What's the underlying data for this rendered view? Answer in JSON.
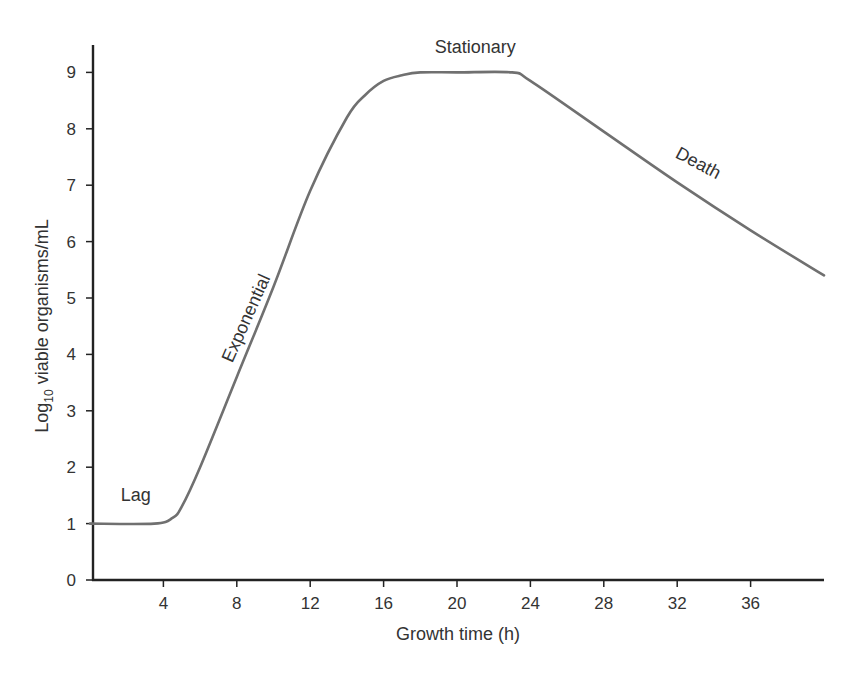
{
  "chart_data": {
    "type": "line",
    "title": "",
    "xlabel": "Growth time (h)",
    "ylabel": "Log10 viable organisms/mL",
    "ylabel_parts": {
      "base": "Log",
      "sub": "10",
      "rest": " viable organisms/mL"
    },
    "xlim": [
      0,
      40
    ],
    "ylim": [
      0,
      9.5
    ],
    "x_ticks": [
      4,
      8,
      12,
      16,
      20,
      24,
      28,
      32,
      36
    ],
    "y_ticks": [
      0,
      1,
      2,
      3,
      4,
      5,
      6,
      7,
      8,
      9
    ],
    "grid": false,
    "legend": null,
    "series": [
      {
        "name": "Bacterial growth curve",
        "color": "#707070",
        "x": [
          0,
          3.5,
          4.5,
          5,
          6,
          8,
          10,
          12,
          14,
          15,
          16,
          17,
          18,
          20,
          23,
          24,
          28,
          32,
          36,
          40
        ],
        "y": [
          1.0,
          1.0,
          1.1,
          1.3,
          2.0,
          3.6,
          5.2,
          6.9,
          8.2,
          8.6,
          8.85,
          8.95,
          9.0,
          9.0,
          9.0,
          8.85,
          7.95,
          7.05,
          6.2,
          5.4
        ]
      }
    ],
    "annotations": [
      {
        "text": "Lag",
        "x": 2.5,
        "y": 1.4
      },
      {
        "text": "Exponential",
        "x": 8.8,
        "y": 4.6,
        "rotation": -66
      },
      {
        "text": "Stationary",
        "x": 21,
        "y": 9.35
      },
      {
        "text": "Death",
        "x": 33,
        "y": 7.3,
        "rotation": 28
      }
    ]
  }
}
